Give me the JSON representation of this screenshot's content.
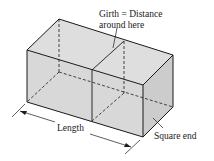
{
  "diagram": {
    "labels": {
      "girth_line1": "Girth = Distance",
      "girth_line2": "around here",
      "length": "Length",
      "square_end": "Square end"
    },
    "colors": {
      "face_fill": "#dcdcdc",
      "end_fill": "#cfcfcf",
      "stroke": "#1a1a1a"
    }
  }
}
